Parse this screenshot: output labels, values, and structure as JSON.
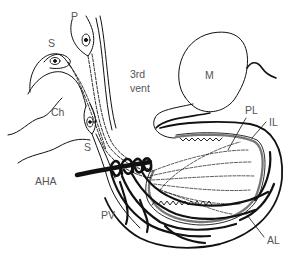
{
  "diagram": {
    "type": "anatomical-line-drawing",
    "colors": {
      "background": "#ffffff",
      "line": "#111111",
      "label": "#555555",
      "stipple": "#9a9a9a"
    },
    "labels": {
      "P": "P",
      "S_top": "S",
      "Ch": "Ch",
      "third_vent_line1": "3rd",
      "third_vent_line2": "vent",
      "M": "M",
      "S_lower": "S",
      "PL": "PL",
      "IL": "IL",
      "AHA": "AHA",
      "PV": "PV",
      "AL": "AL"
    }
  }
}
